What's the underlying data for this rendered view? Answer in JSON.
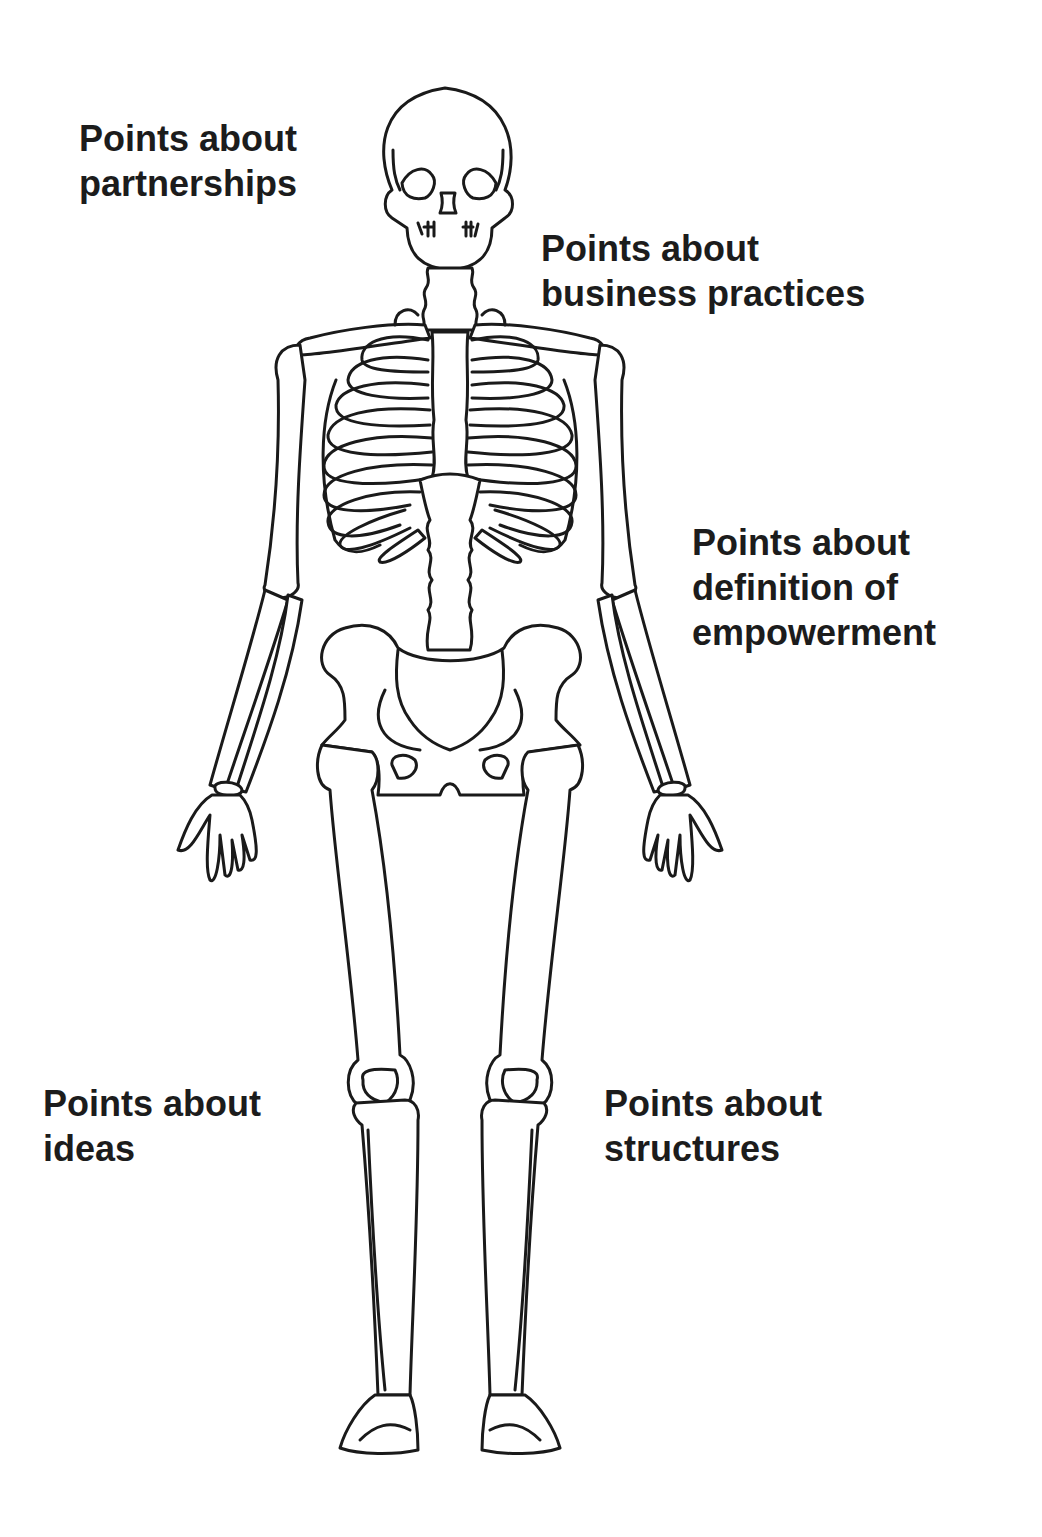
{
  "diagram": {
    "colors": {
      "text": "#1c1c1c",
      "outline": "#1a1a1a",
      "background": "#ffffff"
    },
    "labels": [
      {
        "id": "partnerships",
        "lines": [
          "Points about",
          "partnerships"
        ]
      },
      {
        "id": "business-practices",
        "lines": [
          "Points about",
          "business practices"
        ]
      },
      {
        "id": "definition-of-empowerment",
        "lines": [
          "Points about",
          "definition of",
          "empowerment"
        ]
      },
      {
        "id": "ideas",
        "lines": [
          "Points about",
          "ideas"
        ]
      },
      {
        "id": "structures",
        "lines": [
          "Points about",
          "structures"
        ]
      }
    ]
  }
}
